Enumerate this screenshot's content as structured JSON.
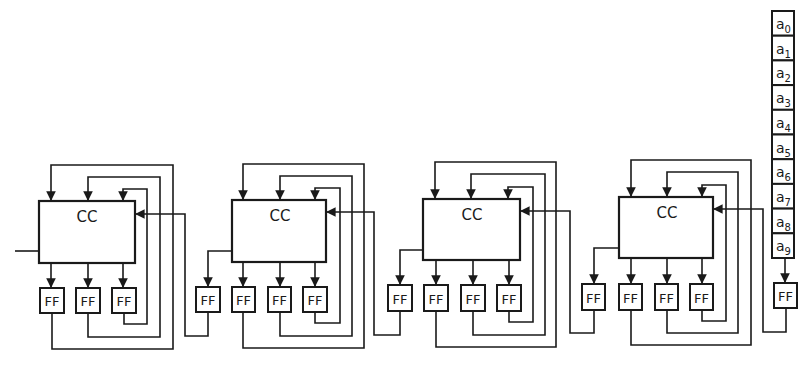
{
  "diagram": {
    "type": "shift-register circuit with combinational circuits and flip-flops",
    "cc_label": "CC",
    "ff_label": "FF",
    "stroke_color": "#1a1a1a",
    "background": "#ffffff",
    "blocks": [
      {
        "id": "block-1",
        "cc": "CC",
        "flipflops": [
          "FF",
          "FF",
          "FF"
        ]
      },
      {
        "id": "block-2",
        "cc": "CC",
        "flipflops": [
          "FF",
          "FF",
          "FF",
          "FF"
        ]
      },
      {
        "id": "block-3",
        "cc": "CC",
        "flipflops": [
          "FF",
          "FF",
          "FF",
          "FF"
        ]
      },
      {
        "id": "block-4",
        "cc": "CC",
        "flipflops": [
          "FF",
          "FF",
          "FF",
          "FF"
        ]
      }
    ],
    "register": {
      "cells": [
        {
          "base": "a",
          "sub": "0"
        },
        {
          "base": "a",
          "sub": "1"
        },
        {
          "base": "a",
          "sub": "2"
        },
        {
          "base": "a",
          "sub": "3"
        },
        {
          "base": "a",
          "sub": "4"
        },
        {
          "base": "a",
          "sub": "5"
        },
        {
          "base": "a",
          "sub": "6"
        },
        {
          "base": "a",
          "sub": "7"
        },
        {
          "base": "a",
          "sub": "8"
        },
        {
          "base": "a",
          "sub": "9"
        }
      ],
      "output_ff": "FF"
    }
  }
}
